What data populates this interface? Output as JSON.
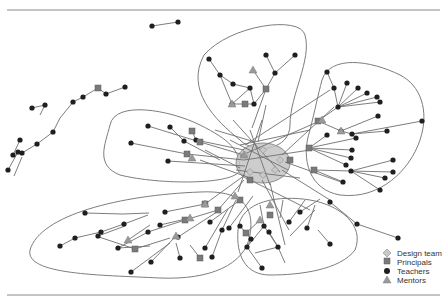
{
  "legend": {
    "items": [
      {
        "label": "Design team",
        "shape": "diamond",
        "color": "#c8c8c8"
      },
      {
        "label": "Principals",
        "shape": "square",
        "color": "#7a7a7a"
      },
      {
        "label": "Teachers",
        "shape": "circle",
        "color": "#1f1f1f"
      },
      {
        "label": "Mentors",
        "shape": "triangle",
        "color": "#9a9a9a"
      }
    ]
  },
  "colors": {
    "rule": "#8a8a8a",
    "hull": "#7d7d7d",
    "edge": "#6e6e6e",
    "core_fill": "#c4c4c4"
  },
  "network": {
    "core": {
      "cx": 263,
      "cy": 163,
      "rx": 27,
      "ry": 20
    },
    "hulls": [
      "M204,55 C230,25 300,15 305,35 C312,60 290,95 290,125 C290,150 255,155 240,140 C215,120 185,90 204,55 Z",
      "M322,80 C330,55 370,60 400,75 C420,85 430,110 420,140 C410,170 380,200 340,195 C310,190 300,160 310,130 C315,110 318,95 322,80 Z",
      "M110,125 C115,100 170,110 200,125 C230,140 240,150 240,170 C235,185 160,185 120,175 C95,165 105,145 110,125 Z",
      "M30,250 C40,215 120,195 200,192 C240,190 255,205 250,235 C245,265 210,280 160,278 C100,275 25,275 30,250 Z",
      "M238,230 C240,200 280,195 310,200 C340,205 365,225 355,250 C340,270 300,275 270,275 C245,275 236,255 238,230 Z"
    ],
    "edges": [
      [
        22,
        153,
        37,
        144
      ],
      [
        37,
        144,
        53,
        132
      ],
      [
        53,
        132,
        60,
        118
      ],
      [
        60,
        118,
        73,
        102
      ],
      [
        73,
        102,
        83,
        97
      ],
      [
        83,
        97,
        98,
        88
      ],
      [
        98,
        88,
        106,
        94
      ],
      [
        106,
        94,
        125,
        87
      ],
      [
        13,
        155,
        20,
        140
      ],
      [
        32,
        108,
        45,
        105
      ],
      [
        45,
        105,
        40,
        115
      ],
      [
        152,
        26,
        178,
        22
      ],
      [
        8,
        170,
        18,
        152
      ],
      [
        14,
        176,
        22,
        157
      ],
      [
        266,
        55,
        275,
        73
      ],
      [
        295,
        55,
        275,
        73
      ],
      [
        275,
        73,
        266,
        89
      ],
      [
        266,
        89,
        254,
        104
      ],
      [
        266,
        89,
        252,
        128
      ],
      [
        253,
        70,
        266,
        89
      ],
      [
        209,
        59,
        220,
        75
      ],
      [
        220,
        75,
        233,
        84
      ],
      [
        233,
        84,
        250,
        88
      ],
      [
        220,
        75,
        232,
        104
      ],
      [
        232,
        104,
        254,
        104
      ],
      [
        250,
        88,
        254,
        104
      ],
      [
        250,
        88,
        232,
        104
      ],
      [
        327,
        72,
        334,
        88
      ],
      [
        334,
        88,
        338,
        107
      ],
      [
        338,
        107,
        347,
        83
      ],
      [
        338,
        107,
        358,
        88
      ],
      [
        338,
        107,
        367,
        93
      ],
      [
        338,
        107,
        377,
        97
      ],
      [
        338,
        107,
        380,
        102
      ],
      [
        338,
        107,
        318,
        121
      ],
      [
        318,
        121,
        341,
        131
      ],
      [
        341,
        131,
        378,
        116
      ],
      [
        341,
        131,
        352,
        134
      ],
      [
        352,
        134,
        387,
        131
      ],
      [
        352,
        134,
        422,
        121
      ],
      [
        309,
        148,
        327,
        135
      ],
      [
        309,
        148,
        356,
        138
      ],
      [
        309,
        148,
        352,
        150
      ],
      [
        309,
        148,
        351,
        158
      ],
      [
        309,
        148,
        346,
        165
      ],
      [
        314,
        170,
        351,
        171
      ],
      [
        351,
        171,
        393,
        160
      ],
      [
        351,
        171,
        393,
        172
      ],
      [
        351,
        171,
        385,
        178
      ],
      [
        351,
        171,
        380,
        190
      ],
      [
        314,
        170,
        343,
        182
      ],
      [
        148,
        126,
        200,
        142
      ],
      [
        200,
        142,
        244,
        155
      ],
      [
        131,
        143,
        187,
        154
      ],
      [
        187,
        154,
        244,
        160
      ],
      [
        170,
        127,
        184,
        141
      ],
      [
        184,
        141,
        220,
        160
      ],
      [
        168,
        161,
        245,
        166
      ],
      [
        192,
        131,
        196,
        140
      ],
      [
        196,
        140,
        244,
        150
      ],
      [
        118,
        248,
        148,
        232
      ],
      [
        148,
        232,
        185,
        220
      ],
      [
        185,
        220,
        218,
        210
      ],
      [
        218,
        210,
        244,
        180
      ],
      [
        165,
        212,
        205,
        204
      ],
      [
        205,
        204,
        245,
        175
      ],
      [
        178,
        237,
        220,
        210
      ],
      [
        210,
        222,
        240,
        200
      ],
      [
        205,
        248,
        228,
        209
      ],
      [
        229,
        228,
        253,
        196
      ],
      [
        240,
        226,
        251,
        239
      ],
      [
        251,
        239,
        247,
        247
      ],
      [
        247,
        247,
        262,
        268
      ],
      [
        264,
        226,
        278,
        247
      ],
      [
        278,
        247,
        255,
        253
      ],
      [
        278,
        247,
        285,
        263
      ],
      [
        269,
        232,
        278,
        247
      ],
      [
        247,
        247,
        264,
        226
      ],
      [
        246,
        233,
        260,
        220
      ],
      [
        289,
        222,
        305,
        200
      ],
      [
        307,
        228,
        315,
        205
      ],
      [
        330,
        244,
        318,
        230
      ],
      [
        264,
        226,
        260,
        205
      ],
      [
        280,
        218,
        283,
        200
      ],
      [
        290,
        236,
        315,
        210
      ],
      [
        330,
        202,
        357,
        224
      ],
      [
        357,
        224,
        398,
        238
      ],
      [
        300,
        212,
        320,
        199
      ],
      [
        160,
        225,
        190,
        218
      ],
      [
        200,
        258,
        190,
        245
      ],
      [
        180,
        258,
        176,
        243
      ],
      [
        118,
        248,
        150,
        246
      ],
      [
        60,
        246,
        75,
        238
      ],
      [
        75,
        238,
        101,
        232
      ],
      [
        101,
        232,
        124,
        224
      ],
      [
        124,
        224,
        148,
        215
      ],
      [
        98,
        236,
        125,
        226
      ],
      [
        85,
        213,
        123,
        214
      ],
      [
        123,
        214,
        149,
        213
      ],
      [
        99,
        237,
        135,
        249
      ],
      [
        135,
        249,
        170,
        238
      ],
      [
        131,
        272,
        170,
        243
      ],
      [
        151,
        262,
        176,
        236
      ],
      [
        128,
        240,
        150,
        225
      ],
      [
        236,
        200,
        222,
        230
      ],
      [
        222,
        230,
        212,
        257
      ],
      [
        244,
        160,
        310,
        150
      ],
      [
        240,
        156,
        322,
        120
      ],
      [
        236,
        170,
        300,
        178
      ],
      [
        250,
        180,
        310,
        210
      ],
      [
        262,
        180,
        289,
        230
      ],
      [
        270,
        183,
        285,
        245
      ],
      [
        282,
        170,
        330,
        200
      ],
      [
        230,
        140,
        288,
        170
      ],
      [
        240,
        145,
        310,
        130
      ],
      [
        245,
        145,
        330,
        90
      ],
      [
        282,
        155,
        334,
        107
      ],
      [
        285,
        162,
        344,
        183
      ],
      [
        215,
        130,
        255,
        142
      ],
      [
        205,
        150,
        240,
        168
      ],
      [
        200,
        160,
        250,
        178
      ],
      [
        250,
        130,
        270,
        185
      ],
      [
        262,
        120,
        238,
        192
      ],
      [
        266,
        105,
        258,
        142
      ],
      [
        233,
        120,
        280,
        172
      ]
    ],
    "teachers": [
      [
        22,
        153
      ],
      [
        37,
        144
      ],
      [
        53,
        132
      ],
      [
        73,
        102
      ],
      [
        83,
        97
      ],
      [
        106,
        94
      ],
      [
        125,
        87
      ],
      [
        13,
        155
      ],
      [
        20,
        140
      ],
      [
        32,
        108
      ],
      [
        45,
        105
      ],
      [
        8,
        170
      ],
      [
        18,
        152
      ],
      [
        152,
        26
      ],
      [
        178,
        22
      ],
      [
        266,
        55
      ],
      [
        295,
        55
      ],
      [
        275,
        73
      ],
      [
        209,
        59
      ],
      [
        220,
        75
      ],
      [
        233,
        84
      ],
      [
        250,
        88
      ],
      [
        266,
        89
      ],
      [
        232,
        104
      ],
      [
        254,
        104
      ],
      [
        327,
        72
      ],
      [
        334,
        88
      ],
      [
        338,
        107
      ],
      [
        347,
        83
      ],
      [
        358,
        88
      ],
      [
        367,
        93
      ],
      [
        377,
        97
      ],
      [
        380,
        102
      ],
      [
        341,
        131
      ],
      [
        352,
        134
      ],
      [
        378,
        116
      ],
      [
        387,
        131
      ],
      [
        422,
        121
      ],
      [
        327,
        135
      ],
      [
        356,
        138
      ],
      [
        352,
        150
      ],
      [
        351,
        158
      ],
      [
        346,
        165
      ],
      [
        351,
        171
      ],
      [
        393,
        160
      ],
      [
        393,
        172
      ],
      [
        385,
        178
      ],
      [
        380,
        190
      ],
      [
        343,
        182
      ],
      [
        148,
        126
      ],
      [
        131,
        143
      ],
      [
        170,
        127
      ],
      [
        184,
        141
      ],
      [
        168,
        161
      ],
      [
        118,
        248
      ],
      [
        148,
        232
      ],
      [
        165,
        212
      ],
      [
        178,
        237
      ],
      [
        210,
        222
      ],
      [
        205,
        248
      ],
      [
        229,
        228
      ],
      [
        240,
        226
      ],
      [
        251,
        239
      ],
      [
        247,
        247
      ],
      [
        262,
        268
      ],
      [
        264,
        226
      ],
      [
        278,
        247
      ],
      [
        269,
        232
      ],
      [
        289,
        222
      ],
      [
        307,
        228
      ],
      [
        330,
        244
      ],
      [
        330,
        202
      ],
      [
        357,
        224
      ],
      [
        398,
        238
      ],
      [
        160,
        225
      ],
      [
        180,
        258
      ],
      [
        60,
        246
      ],
      [
        75,
        238
      ],
      [
        101,
        232
      ],
      [
        124,
        224
      ],
      [
        98,
        236
      ],
      [
        85,
        213
      ],
      [
        131,
        272
      ],
      [
        151,
        262
      ],
      [
        300,
        212
      ],
      [
        222,
        230
      ],
      [
        212,
        257
      ],
      [
        196,
        140
      ]
    ],
    "principals": [
      [
        98,
        88
      ],
      [
        266,
        89
      ],
      [
        245,
        104
      ],
      [
        318,
        121
      ],
      [
        309,
        148
      ],
      [
        314,
        170
      ],
      [
        200,
        142
      ],
      [
        187,
        154
      ],
      [
        192,
        131
      ],
      [
        185,
        220
      ],
      [
        218,
        210
      ],
      [
        205,
        204
      ],
      [
        246,
        233
      ],
      [
        200,
        258
      ],
      [
        250,
        180
      ],
      [
        135,
        249
      ],
      [
        240,
        200
      ],
      [
        270,
        215
      ],
      [
        290,
        160
      ]
    ],
    "mentors": [
      [
        253,
        70
      ],
      [
        232,
        104
      ],
      [
        322,
        120
      ],
      [
        341,
        131
      ],
      [
        192,
        158
      ],
      [
        244,
        155
      ],
      [
        128,
        240
      ],
      [
        176,
        236
      ],
      [
        190,
        218
      ],
      [
        270,
        205
      ],
      [
        260,
        220
      ],
      [
        205,
        204
      ],
      [
        235,
        196
      ]
    ],
    "design": [
      [
        245,
        155
      ],
      [
        263,
        150
      ],
      [
        280,
        160
      ],
      [
        263,
        175
      ],
      [
        250,
        172
      ],
      [
        275,
        170
      ]
    ]
  }
}
